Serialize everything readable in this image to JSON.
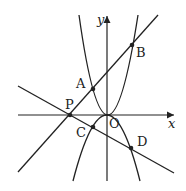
{
  "diagram": {
    "axes": {
      "x_label": "x",
      "y_label": "y",
      "origin_label": "O"
    },
    "points": [
      {
        "id": "P",
        "label": "P",
        "x": 70,
        "y": 115,
        "lx": 63,
        "ly": 106
      },
      {
        "id": "A",
        "label": "A",
        "x": 93,
        "y": 89,
        "lx": 75,
        "ly": 89
      },
      {
        "id": "B",
        "label": "B",
        "x": 132,
        "y": 45,
        "lx": 136,
        "ly": 57
      },
      {
        "id": "C",
        "label": "C",
        "x": 93,
        "y": 127,
        "lx": 75,
        "ly": 137
      },
      {
        "id": "D",
        "label": "D",
        "x": 131,
        "y": 148,
        "lx": 137,
        "ly": 145
      }
    ],
    "curves": {
      "upper_parabola": "opens upward through O, A, B",
      "lower_parabola": "opens downward through O, C, D"
    },
    "lines": [
      "line through P, A, B",
      "line through P, C, D"
    ],
    "colors": {
      "stroke": "#222222",
      "background": "#ffffff"
    }
  }
}
